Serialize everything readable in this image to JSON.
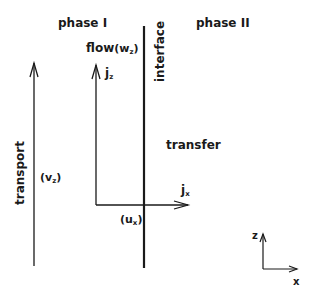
{
  "labels": {
    "phase1": "phase I",
    "phase2": "phase II",
    "flow": "flow",
    "flow_var": "(w",
    "flow_sub": "z",
    "flow_close": ")",
    "jz": "j",
    "jz_sub": "z",
    "interface": "interface",
    "transfer": "transfer",
    "transport": "transport",
    "vz": "(v",
    "vz_sub": "z",
    "vz_close": ")",
    "jx": "j",
    "jx_sub": "x",
    "ux": "(u",
    "ux_sub": "x",
    "ux_close": ")",
    "axis_z": "z",
    "axis_x": "x"
  },
  "colors": {
    "line": "#1a1a1a",
    "background": "#ffffff"
  }
}
